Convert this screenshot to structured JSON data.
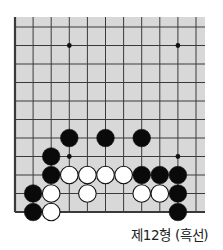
{
  "diagram": {
    "type": "go-problem",
    "board": {
      "background": "#d8d8d8",
      "line_color": "#3a3a3a",
      "columns_visible": 11,
      "rows_visible": 11,
      "left_edge": true,
      "bottom_edge": true,
      "x0": 15,
      "dx": 18.1,
      "y0": 27,
      "dy": 18.5,
      "bg_rect": {
        "x": 14,
        "y": 17,
        "w": 191,
        "h": 196
      },
      "star_points": [
        [
          3,
          1
        ],
        [
          9,
          1
        ],
        [
          3,
          7
        ],
        [
          9,
          7
        ]
      ]
    },
    "stones": [
      {
        "color": "black",
        "col": 3,
        "row": 6
      },
      {
        "color": "black",
        "col": 5,
        "row": 6
      },
      {
        "color": "black",
        "col": 7,
        "row": 6
      },
      {
        "color": "black",
        "col": 2,
        "row": 7
      },
      {
        "color": "black",
        "col": 2,
        "row": 8
      },
      {
        "color": "white",
        "col": 3,
        "row": 8
      },
      {
        "color": "white",
        "col": 4,
        "row": 8
      },
      {
        "color": "white",
        "col": 5,
        "row": 8
      },
      {
        "color": "white",
        "col": 6,
        "row": 8
      },
      {
        "color": "black",
        "col": 7,
        "row": 8
      },
      {
        "color": "black",
        "col": 8,
        "row": 8
      },
      {
        "color": "black",
        "col": 9,
        "row": 8
      },
      {
        "color": "black",
        "col": 1,
        "row": 9
      },
      {
        "color": "white",
        "col": 2,
        "row": 9
      },
      {
        "color": "white",
        "col": 4,
        "row": 9
      },
      {
        "color": "white",
        "col": 7,
        "row": 9
      },
      {
        "color": "white",
        "col": 8,
        "row": 9
      },
      {
        "color": "black",
        "col": 9,
        "row": 9
      },
      {
        "color": "black",
        "col": 1,
        "row": 10
      },
      {
        "color": "white",
        "col": 2,
        "row": 10
      },
      {
        "color": "black",
        "col": 9,
        "row": 10
      }
    ],
    "caption": "제12형 (흑선)"
  }
}
